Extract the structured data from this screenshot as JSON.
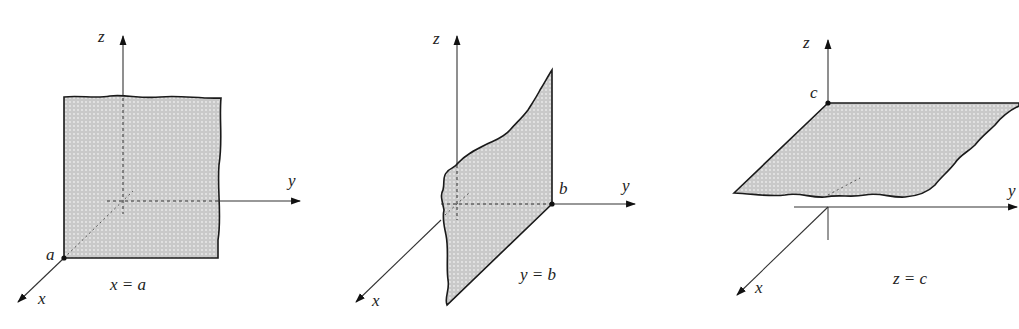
{
  "figure": {
    "panels": [
      {
        "id": "plane-x",
        "axes": {
          "x": "x",
          "y": "y",
          "z": "z"
        },
        "point_label": "a",
        "caption": "x = a"
      },
      {
        "id": "plane-y",
        "axes": {
          "x": "x",
          "y": "y",
          "z": "z"
        },
        "point_label": "b",
        "caption": "y = b"
      },
      {
        "id": "plane-z",
        "axes": {
          "x": "x",
          "y": "y",
          "z": "z"
        },
        "point_label": "c",
        "caption": "z = c"
      }
    ],
    "colors": {
      "plane_fill": "#cfcfcf",
      "stroke": "#1a1a1a",
      "axis": "#333333"
    }
  }
}
